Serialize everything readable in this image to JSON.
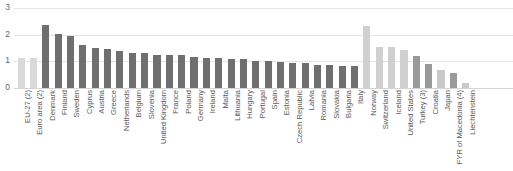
{
  "chart_data": {
    "type": "bar",
    "title": "",
    "subtitle": "",
    "xlabel": "",
    "ylabel": "",
    "ylim": [
      0,
      3
    ],
    "yticks": [
      "0",
      "1",
      "2",
      "3"
    ],
    "grid": true,
    "legend": "none",
    "orientation": "vertical",
    "colors": {
      "aggregate": "#d9d9d9",
      "member": "#6f6f6f",
      "efta": "#d0d0d0",
      "candidate": "#9a9a9a",
      "other": "#c8c8c8",
      "gridline": "#e4e4e4",
      "text": "#5a5a5a"
    },
    "categories": [
      "EU-27 (2)",
      "Euro area (2)",
      "Denmark",
      "Finland",
      "Sweden",
      "Cyprus",
      "Austria",
      "Greece",
      "Netherlands",
      "Belgium",
      "Slovenia",
      "United Kingdom",
      "France",
      "Poland",
      "Germany",
      "Ireland",
      "Malta",
      "Lithuania",
      "Hungary",
      "Portugal",
      "Spain",
      "Estonia",
      "Czech Republic",
      "Latvia",
      "Romania",
      "Slovakia",
      "Bulgaria",
      "Italy",
      "Norway",
      "Switzerland",
      "Iceland",
      "United States",
      "Turkey (3)",
      "Croatia",
      "Japan",
      "FYR of Macedonia (4)",
      "Liechtenstein"
    ],
    "values": [
      1.13,
      1.11,
      2.37,
      2.02,
      1.95,
      1.62,
      1.51,
      1.47,
      1.4,
      1.31,
      1.3,
      1.24,
      1.23,
      1.23,
      1.18,
      1.13,
      1.12,
      1.08,
      1.07,
      1.03,
      1.0,
      0.96,
      0.94,
      0.93,
      0.86,
      0.85,
      0.82,
      0.82,
      2.33,
      1.55,
      1.53,
      1.42,
      1.2,
      0.89,
      0.66,
      0.57,
      0.2
    ],
    "groups": [
      "aggregate",
      "aggregate",
      "member",
      "member",
      "member",
      "member",
      "member",
      "member",
      "member",
      "member",
      "member",
      "member",
      "member",
      "member",
      "member",
      "member",
      "member",
      "member",
      "member",
      "member",
      "member",
      "member",
      "member",
      "member",
      "member",
      "member",
      "member",
      "member",
      "efta",
      "efta",
      "efta",
      "efta",
      "candidate",
      "candidate",
      "other",
      "candidate",
      "other"
    ]
  }
}
